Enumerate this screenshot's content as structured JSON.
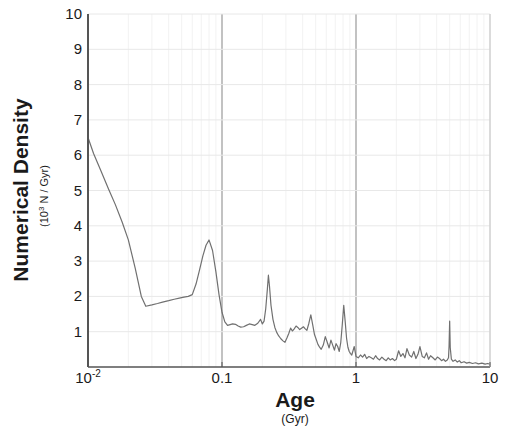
{
  "chart_data": {
    "type": "line",
    "title": "",
    "subtitle": "",
    "xlabel": "Age",
    "xlabel_units": "(Gyr)",
    "ylabel": "Numerical Density",
    "ylabel_units": "(10³ N / Gyr)",
    "ylabel_units_base": "(10",
    "ylabel_units_exp": "3",
    "ylabel_units_tail": " N / Gyr)",
    "xscale": "log",
    "yscale": "linear",
    "xlim": [
      0.01,
      10
    ],
    "ylim": [
      0,
      10
    ],
    "grid": true,
    "grid_minor": true,
    "legend": "none",
    "line_color": "#707070",
    "axis_color": "#555555",
    "grid_color": "#e8e8e8",
    "grid_minor_color": "#f2f2f2",
    "text_color": "#1a1a1a",
    "xticks_major": [
      {
        "value": 0.01,
        "label": "10",
        "sup": "-2"
      },
      {
        "value": 0.1,
        "label": "0.1",
        "sup": ""
      },
      {
        "value": 1,
        "label": "1",
        "sup": ""
      },
      {
        "value": 10,
        "label": "10",
        "sup": ""
      }
    ],
    "yticks": [
      {
        "value": 1,
        "label": "1"
      },
      {
        "value": 2,
        "label": "2"
      },
      {
        "value": 3,
        "label": "3"
      },
      {
        "value": 4,
        "label": "4"
      },
      {
        "value": 5,
        "label": "5"
      },
      {
        "value": 6,
        "label": "6"
      },
      {
        "value": 7,
        "label": "7"
      },
      {
        "value": 8,
        "label": "8"
      },
      {
        "value": 9,
        "label": "9"
      },
      {
        "value": 10,
        "label": "10"
      }
    ],
    "series": [
      {
        "name": "numerical density",
        "x": [
          0.01,
          0.011,
          0.0125,
          0.0142,
          0.016,
          0.018,
          0.02,
          0.0225,
          0.025,
          0.027,
          0.03,
          0.033,
          0.036,
          0.04,
          0.044,
          0.048,
          0.052,
          0.056,
          0.06,
          0.064,
          0.068,
          0.072,
          0.076,
          0.08,
          0.085,
          0.09,
          0.095,
          0.1,
          0.105,
          0.11,
          0.115,
          0.12,
          0.126,
          0.132,
          0.138,
          0.145,
          0.152,
          0.16,
          0.168,
          0.176,
          0.185,
          0.194,
          0.2,
          0.206,
          0.212,
          0.218,
          0.222,
          0.226,
          0.232,
          0.24,
          0.248,
          0.256,
          0.265,
          0.275,
          0.285,
          0.295,
          0.305,
          0.315,
          0.325,
          0.335,
          0.346,
          0.357,
          0.368,
          0.38,
          0.392,
          0.405,
          0.418,
          0.43,
          0.445,
          0.46,
          0.475,
          0.49,
          0.505,
          0.52,
          0.535,
          0.55,
          0.57,
          0.59,
          0.61,
          0.63,
          0.65,
          0.67,
          0.69,
          0.71,
          0.73,
          0.75,
          0.77,
          0.79,
          0.81,
          0.83,
          0.85,
          0.87,
          0.89,
          0.91,
          0.93,
          0.95,
          0.97,
          1.0,
          1.04,
          1.08,
          1.12,
          1.16,
          1.2,
          1.25,
          1.3,
          1.35,
          1.4,
          1.45,
          1.5,
          1.56,
          1.62,
          1.68,
          1.74,
          1.8,
          1.87,
          1.94,
          2.0,
          2.08,
          2.16,
          2.24,
          2.32,
          2.4,
          2.5,
          2.6,
          2.7,
          2.8,
          2.9,
          3.0,
          3.12,
          3.24,
          3.36,
          3.48,
          3.6,
          3.75,
          3.9,
          4.05,
          4.2,
          4.35,
          4.5,
          4.65,
          4.8,
          4.9,
          4.95,
          5.0,
          5.05,
          5.15,
          5.3,
          5.5,
          5.7,
          5.9,
          6.1,
          6.4,
          6.7,
          7.0,
          7.4,
          7.8,
          8.2,
          8.7,
          9.2,
          9.6,
          10.0
        ],
        "y": [
          6.5,
          6.05,
          5.55,
          5.05,
          4.6,
          4.1,
          3.6,
          2.8,
          2.0,
          1.72,
          1.76,
          1.8,
          1.84,
          1.88,
          1.92,
          1.95,
          1.98,
          2.0,
          2.05,
          2.35,
          2.75,
          3.15,
          3.45,
          3.6,
          3.3,
          2.7,
          2.05,
          1.55,
          1.28,
          1.18,
          1.2,
          1.22,
          1.21,
          1.16,
          1.13,
          1.14,
          1.18,
          1.22,
          1.2,
          1.18,
          1.24,
          1.35,
          1.22,
          1.3,
          1.65,
          2.2,
          2.6,
          2.3,
          1.75,
          1.35,
          1.12,
          0.98,
          0.88,
          0.8,
          0.74,
          0.7,
          0.82,
          0.95,
          1.1,
          1.02,
          1.08,
          1.16,
          1.12,
          1.06,
          1.1,
          1.14,
          1.08,
          1.04,
          1.24,
          1.48,
          1.2,
          0.92,
          0.78,
          0.64,
          0.56,
          0.5,
          0.62,
          0.86,
          0.7,
          0.54,
          0.76,
          0.62,
          0.48,
          0.66,
          0.58,
          0.44,
          0.7,
          1.2,
          1.75,
          1.3,
          0.82,
          0.56,
          0.44,
          0.38,
          0.34,
          0.46,
          0.58,
          0.3,
          0.26,
          0.34,
          0.28,
          0.36,
          0.24,
          0.3,
          0.26,
          0.22,
          0.32,
          0.24,
          0.2,
          0.28,
          0.22,
          0.18,
          0.26,
          0.2,
          0.24,
          0.18,
          0.22,
          0.46,
          0.3,
          0.38,
          0.26,
          0.52,
          0.34,
          0.28,
          0.44,
          0.24,
          0.36,
          0.58,
          0.3,
          0.26,
          0.4,
          0.22,
          0.32,
          0.26,
          0.2,
          0.28,
          0.24,
          0.18,
          0.22,
          0.16,
          0.2,
          0.26,
          0.6,
          1.3,
          0.55,
          0.22,
          0.16,
          0.2,
          0.14,
          0.18,
          0.12,
          0.15,
          0.11,
          0.13,
          0.1,
          0.12,
          0.09,
          0.11,
          0.08,
          0.1,
          0.08
        ]
      }
    ]
  }
}
